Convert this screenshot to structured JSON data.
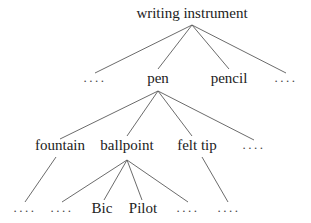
{
  "diagram": {
    "type": "tree",
    "root": "writing instrument",
    "nodes": [
      {
        "id": "root",
        "label": "writing instrument",
        "x": 192,
        "y": 6,
        "kind": "label"
      },
      {
        "id": "l1_ell_left",
        "label": "....",
        "x": 95,
        "y": 71,
        "kind": "ellipsis"
      },
      {
        "id": "pen",
        "label": "pen",
        "x": 158,
        "y": 71,
        "kind": "label"
      },
      {
        "id": "pencil",
        "label": "pencil",
        "x": 229,
        "y": 71,
        "kind": "label"
      },
      {
        "id": "l1_ell_right",
        "label": "....",
        "x": 286,
        "y": 71,
        "kind": "ellipsis"
      },
      {
        "id": "fountain",
        "label": "fountain",
        "x": 60,
        "y": 138,
        "kind": "label"
      },
      {
        "id": "ballpoint",
        "label": "ballpoint",
        "x": 127,
        "y": 138,
        "kind": "label"
      },
      {
        "id": "felt_tip",
        "label": "felt tip",
        "x": 197,
        "y": 138,
        "kind": "label"
      },
      {
        "id": "l2_ell_right",
        "label": "....",
        "x": 254,
        "y": 138,
        "kind": "ellipsis"
      },
      {
        "id": "l3_ell_1",
        "label": "....",
        "x": 25,
        "y": 201,
        "kind": "ellipsis"
      },
      {
        "id": "l3_ell_2",
        "label": "....",
        "x": 62,
        "y": 201,
        "kind": "ellipsis"
      },
      {
        "id": "bic",
        "label": "Bic",
        "x": 102,
        "y": 201,
        "kind": "label"
      },
      {
        "id": "pilot",
        "label": "Pilot",
        "x": 143,
        "y": 201,
        "kind": "label"
      },
      {
        "id": "l3_ell_3",
        "label": "....",
        "x": 188,
        "y": 201,
        "kind": "ellipsis"
      },
      {
        "id": "l3_ell_4",
        "label": "....",
        "x": 229,
        "y": 201,
        "kind": "ellipsis"
      }
    ],
    "edges": [
      {
        "from": "root",
        "to": "l1_ell_left",
        "x1": 192,
        "y1": 25,
        "x2": 95,
        "y2": 73
      },
      {
        "from": "root",
        "to": "pen",
        "x1": 192,
        "y1": 25,
        "x2": 158,
        "y2": 69
      },
      {
        "from": "root",
        "to": "pencil",
        "x1": 192,
        "y1": 25,
        "x2": 229,
        "y2": 69
      },
      {
        "from": "root",
        "to": "l1_ell_right",
        "x1": 192,
        "y1": 25,
        "x2": 286,
        "y2": 73
      },
      {
        "from": "pen",
        "to": "fountain",
        "x1": 158,
        "y1": 91,
        "x2": 60,
        "y2": 139
      },
      {
        "from": "pen",
        "to": "ballpoint",
        "x1": 158,
        "y1": 91,
        "x2": 127,
        "y2": 136
      },
      {
        "from": "pen",
        "to": "felt_tip",
        "x1": 158,
        "y1": 91,
        "x2": 192,
        "y2": 136
      },
      {
        "from": "pen",
        "to": "l2_ell_right",
        "x1": 158,
        "y1": 91,
        "x2": 254,
        "y2": 140
      },
      {
        "from": "fountain",
        "to": "l3_ell_1",
        "x1": 56,
        "y1": 157,
        "x2": 25,
        "y2": 202
      },
      {
        "from": "ballpoint",
        "to": "l3_ell_2",
        "x1": 127,
        "y1": 160,
        "x2": 62,
        "y2": 202
      },
      {
        "from": "ballpoint",
        "to": "bic",
        "x1": 127,
        "y1": 160,
        "x2": 104,
        "y2": 200
      },
      {
        "from": "ballpoint",
        "to": "pilot",
        "x1": 127,
        "y1": 160,
        "x2": 142,
        "y2": 200
      },
      {
        "from": "ballpoint",
        "to": "l3_ell_3",
        "x1": 127,
        "y1": 160,
        "x2": 188,
        "y2": 202
      },
      {
        "from": "felt_tip",
        "to": "l3_ell_4",
        "x1": 202,
        "y1": 157,
        "x2": 228,
        "y2": 202
      }
    ]
  }
}
